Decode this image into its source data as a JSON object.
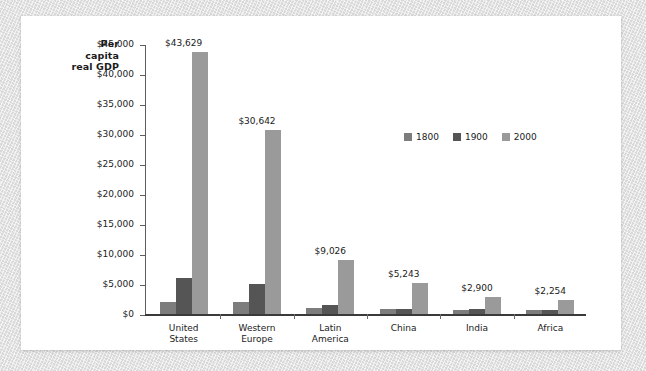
{
  "chart_data": {
    "type": "bar",
    "title": "",
    "xlabel": "",
    "ylabel": "Per capita real GDP",
    "ylim": [
      0,
      45000
    ],
    "grid": false,
    "legend_position": "inside-upper-right",
    "categories": [
      "United States",
      "Western Europe",
      "Latin America",
      "China",
      "India",
      "Africa"
    ],
    "ytick_labels": [
      "$45,000",
      "$40,000",
      "$35,000",
      "$30,000",
      "$25,000",
      "$20,000",
      "$15,000",
      "$10,000",
      "$5,000",
      "$0"
    ],
    "ytick_values": [
      45000,
      40000,
      35000,
      30000,
      25000,
      20000,
      15000,
      10000,
      5000,
      0
    ],
    "series": [
      {
        "name": "1800",
        "color": "#7d7d7d",
        "values": [
          2000,
          2000,
          1000,
          800,
          700,
          600
        ],
        "labels": [
          "",
          "",
          "",
          "",
          "",
          ""
        ]
      },
      {
        "name": "1900",
        "color": "#555555",
        "values": [
          6000,
          5000,
          1500,
          900,
          800,
          700
        ],
        "labels": [
          "",
          "",
          "",
          "",
          "",
          ""
        ]
      },
      {
        "name": "2000",
        "color": "#9a9a9a",
        "values": [
          43629,
          30642,
          9026,
          5243,
          2900,
          2254
        ],
        "labels": [
          "$43,629",
          "$30,642",
          "$9,026",
          "$5,243",
          "$2,900",
          "$2,254"
        ]
      }
    ]
  },
  "axis_title": {
    "line1": "Per",
    "line2": "capita",
    "line3": "real GDP"
  },
  "category_label_lines": [
    [
      "United",
      "States"
    ],
    [
      "Western",
      "Europe"
    ],
    [
      "Latin",
      "America"
    ],
    [
      "China",
      ""
    ],
    [
      "India",
      ""
    ],
    [
      "Africa",
      ""
    ]
  ],
  "colors": {
    "series_1800": "#7d7d7d",
    "series_1900": "#555555",
    "series_2000": "#9a9a9a",
    "axis": "#5d5d5d",
    "baseline": "#3a3a3a",
    "panel_background": "#ffffff",
    "page_background": "#e0e0e0",
    "text": "#1a1a1a"
  }
}
